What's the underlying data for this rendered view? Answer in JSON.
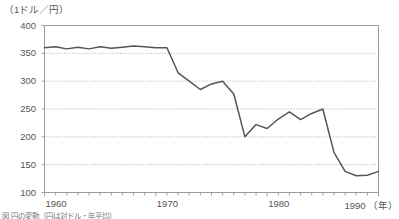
{
  "unit_label": "（1ドル／円）",
  "caption": "図 円の変動（円は対ドル・年平均）",
  "axis_colors": {
    "frame": "#9a9a9a",
    "grid": "#aaaaaa",
    "line": "#555555",
    "text": "#555555"
  },
  "chart_data": {
    "type": "line",
    "title": "",
    "subtitle": "",
    "xlabel": "（年）",
    "ylabel": "（1ドル／円）",
    "xlim": [
      1960,
      1990
    ],
    "ylim": [
      100,
      400
    ],
    "yticks": [
      100,
      150,
      200,
      250,
      300,
      350,
      400
    ],
    "ytick_labels": [
      "100",
      "150",
      "200",
      "250",
      "300",
      "350",
      "400"
    ],
    "xticks": [
      1960,
      1970,
      1980,
      1990
    ],
    "xtick_labels": [
      "1960",
      "1970",
      "1980",
      "1990"
    ],
    "x_minor_tick_interval": 1,
    "grid": "horizontal-dotted",
    "legend": "none",
    "series": [
      {
        "name": "円相場（1ドル＝円）",
        "color": "#555555",
        "x": [
          1960,
          1961,
          1962,
          1963,
          1964,
          1965,
          1966,
          1967,
          1968,
          1969,
          1970,
          1971,
          1972,
          1973,
          1974,
          1975,
          1976,
          1977,
          1978,
          1979,
          1980,
          1981,
          1982,
          1983,
          1984,
          1985,
          1986,
          1987,
          1988,
          1989,
          1990
        ],
        "values": [
          360,
          362,
          358,
          361,
          358,
          362,
          359,
          361,
          363,
          362,
          360,
          360,
          315,
          300,
          285,
          295,
          300,
          277,
          200,
          222,
          215,
          232,
          245,
          231,
          242,
          250,
          172,
          138,
          130,
          131,
          138
        ]
      }
    ]
  },
  "xtick_positions": [
    {
      "label": "1960",
      "value": 1960
    },
    {
      "label": "1970",
      "value": 1970
    },
    {
      "label": "1980",
      "value": 1980
    },
    {
      "label": "1990",
      "value": 1990
    }
  ]
}
